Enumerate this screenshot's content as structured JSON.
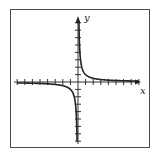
{
  "chart_data": {
    "type": "line",
    "title": "",
    "function": "y = 1/x",
    "xlabel": "x",
    "ylabel": "y",
    "xlim": [
      -8,
      8
    ],
    "ylim": [
      -8,
      8
    ],
    "x_ticks_each_side": 8,
    "y_ticks_each_side": 8,
    "tick_labels": false,
    "grid": false,
    "legend": null,
    "series": [
      {
        "name": "branch-positive",
        "x": [
          0.125,
          0.15,
          0.2,
          0.25,
          0.33,
          0.5,
          0.75,
          1,
          1.5,
          2,
          3,
          4,
          5,
          6,
          7,
          8
        ],
        "y": [
          8,
          6.67,
          5,
          4,
          3.03,
          2,
          1.33,
          1,
          0.67,
          0.5,
          0.33,
          0.25,
          0.2,
          0.17,
          0.14,
          0.125
        ]
      },
      {
        "name": "branch-negative",
        "x": [
          -8,
          -7,
          -6,
          -5,
          -4,
          -3,
          -2,
          -1.5,
          -1,
          -0.75,
          -0.5,
          -0.33,
          -0.25,
          -0.2,
          -0.15,
          -0.125
        ],
        "y": [
          -0.125,
          -0.14,
          -0.17,
          -0.2,
          -0.25,
          -0.33,
          -0.5,
          -0.67,
          -1,
          -1.33,
          -2,
          -3.03,
          -4,
          -5,
          -6.67,
          -8
        ]
      }
    ],
    "colors": {
      "curve": "#222222",
      "axes": "#333333",
      "frame": "#4a4a4a"
    }
  }
}
